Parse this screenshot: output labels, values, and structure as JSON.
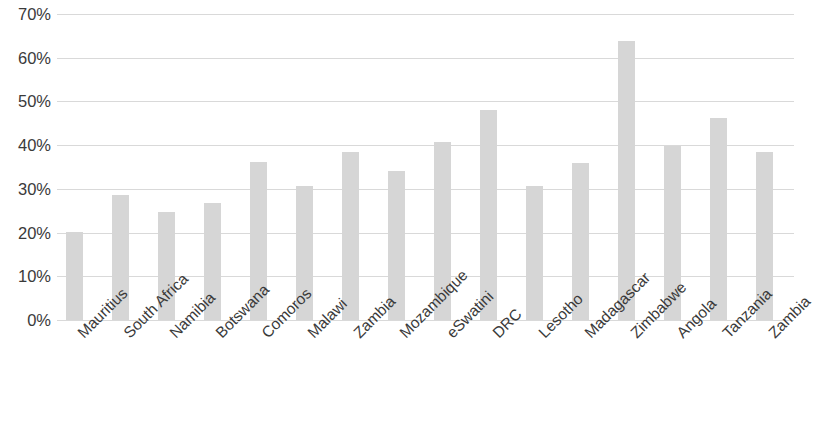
{
  "chart_data": {
    "type": "bar",
    "title": "",
    "subtitle": "",
    "xlabel": "",
    "ylabel": "",
    "ylim": [
      0,
      70
    ],
    "grid": true,
    "legend": false,
    "legend_position": "none",
    "value_suffix": "%",
    "bar_color": "#d6d6d6",
    "gridline_color": "#d9d9d9",
    "text_color": "#3a3a3a",
    "ytick_labels": [
      "70%",
      "60%",
      "50%",
      "40%",
      "30%",
      "20%",
      "10%",
      "0%"
    ],
    "ytick_values": [
      70,
      60,
      50,
      40,
      30,
      20,
      10,
      0
    ],
    "categories": [
      "Mauritius",
      "South Africa",
      "Namibia",
      "Botswana",
      "Comoros",
      "Malawi",
      "Zambia",
      "Mozambique",
      "eSwatini",
      "DRC",
      "Lesotho",
      "Madagascar",
      "Zimbabwe",
      "Angola",
      "Tanzania",
      "Zambia"
    ],
    "values": [
      20.1,
      28.6,
      24.7,
      26.8,
      36.1,
      30.7,
      38.5,
      34.2,
      40.8,
      48.0,
      30.6,
      36.0,
      63.9,
      39.8,
      46.2,
      38.4
    ]
  }
}
